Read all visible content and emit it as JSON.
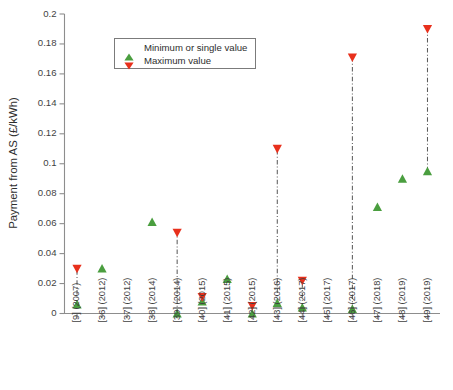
{
  "chart_data": {
    "type": "scatter",
    "title": "",
    "xlabel": "",
    "ylabel": "Payment from AS (£/kWh)",
    "ylim": [
      0,
      0.2
    ],
    "ytick_labels": [
      "0",
      "0.02",
      "0.04",
      "0.06",
      "0.08",
      "0.1",
      "0.12",
      "0.14",
      "0.16",
      "0.18",
      "0.2"
    ],
    "ytick_values": [
      0,
      0.02,
      0.04,
      0.06,
      0.08,
      0.1,
      0.12,
      0.14,
      0.16,
      0.18,
      0.2
    ],
    "grid": false,
    "legend_position": "upper left",
    "legend": [
      {
        "label": "Minimum or single value",
        "marker": "triangle-up",
        "color": "#4a9e3f"
      },
      {
        "label": "Maximum value",
        "marker": "triangle-down",
        "color": "#e8301c"
      }
    ],
    "categories": [
      "[9] (2007)",
      "[36] (2012)",
      "[37] (2012)",
      "[38] (2014)",
      "[39] (2014)",
      "[40] (2015)",
      "[41] (2015)",
      "[42] (2015)",
      "[43] (2016)",
      "[44] (2017)",
      "[45] (2017)",
      "[46] (2017)",
      "[47] (2018)",
      "[48] (2019)",
      "[49] (2019)"
    ],
    "series": [
      {
        "name": "Minimum or single value",
        "values": [
          0.006,
          0.03,
          null,
          0.061,
          0.0,
          0.008,
          0.023,
          0.0,
          0.007,
          0.004,
          null,
          0.003,
          0.071,
          0.09,
          0.095
        ]
      },
      {
        "name": "Maximum value",
        "values": [
          0.03,
          null,
          null,
          null,
          0.054,
          0.011,
          null,
          0.005,
          0.11,
          0.022,
          null,
          0.171,
          null,
          null,
          0.19
        ]
      }
    ]
  },
  "colors": {
    "min_marker": "#4a9e3f",
    "max_marker": "#e8301c",
    "axis": "#8d8d8d",
    "connector": "#5c5c5c",
    "text": "#3f3f3f",
    "background": "#ffffff"
  }
}
